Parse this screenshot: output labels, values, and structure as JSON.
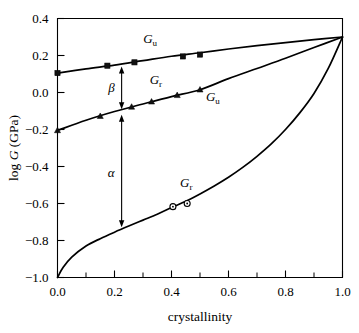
{
  "chart_data": {
    "type": "line",
    "title": "",
    "xlabel": "crystallinity",
    "ylabel": "log G (GPa)",
    "ylabel_parts": {
      "prefix": "log ",
      "italic": "G",
      "suffix": " (GPa)"
    },
    "xlim": [
      0.0,
      1.0
    ],
    "ylim": [
      -1.0,
      0.4
    ],
    "grid": false,
    "legend_position": "inline-annotations",
    "xticks": [
      0.0,
      0.2,
      0.4,
      0.6,
      0.8,
      1.0
    ],
    "xtick_labels": [
      "0.0",
      "0.2",
      "0.4",
      "0.6",
      "0.8",
      "1.0"
    ],
    "xminor_ticks": [
      0.1,
      0.3,
      0.5,
      0.7,
      0.9
    ],
    "yticks": [
      0.4,
      0.2,
      0.0,
      -0.2,
      -0.4,
      -0.6,
      -0.8,
      -1.0
    ],
    "ytick_labels": [
      "0.4",
      "0.2",
      "0.0",
      "-0.2",
      "-0.4",
      "-0.6",
      "-0.8",
      "-1.0"
    ],
    "series": [
      {
        "name": "G_u (upper bound)",
        "label": "G",
        "label_sub": "u",
        "marker": "square",
        "line": [
          {
            "x": 0.0,
            "y": 0.105
          },
          {
            "x": 0.1,
            "y": 0.128
          },
          {
            "x": 0.2,
            "y": 0.148
          },
          {
            "x": 0.3,
            "y": 0.172
          },
          {
            "x": 0.4,
            "y": 0.196
          },
          {
            "x": 0.5,
            "y": 0.215
          },
          {
            "x": 0.6,
            "y": 0.235
          },
          {
            "x": 0.7,
            "y": 0.253
          },
          {
            "x": 0.8,
            "y": 0.27
          },
          {
            "x": 0.9,
            "y": 0.286
          },
          {
            "x": 1.0,
            "y": 0.3
          }
        ],
        "points": [
          {
            "x": 0.0,
            "y": 0.105
          },
          {
            "x": 0.175,
            "y": 0.145
          },
          {
            "x": 0.27,
            "y": 0.163
          },
          {
            "x": 0.44,
            "y": 0.195
          },
          {
            "x": 0.5,
            "y": 0.205
          }
        ]
      },
      {
        "name": "G_r (intermediate)",
        "label": "G",
        "label_sub": "r",
        "marker": "triangle",
        "line": [
          {
            "x": 0.0,
            "y": -0.205
          },
          {
            "x": 0.1,
            "y": -0.15
          },
          {
            "x": 0.2,
            "y": -0.103
          },
          {
            "x": 0.3,
            "y": -0.062
          },
          {
            "x": 0.4,
            "y": -0.022
          },
          {
            "x": 0.5,
            "y": 0.015
          },
          {
            "x": 0.6,
            "y": 0.075
          },
          {
            "x": 0.7,
            "y": 0.13
          },
          {
            "x": 0.8,
            "y": 0.185
          },
          {
            "x": 0.9,
            "y": 0.243
          },
          {
            "x": 1.0,
            "y": 0.3
          }
        ],
        "points": [
          {
            "x": 0.0,
            "y": -0.205
          },
          {
            "x": 0.15,
            "y": -0.128
          },
          {
            "x": 0.26,
            "y": -0.078
          },
          {
            "x": 0.33,
            "y": -0.05
          },
          {
            "x": 0.42,
            "y": -0.015
          },
          {
            "x": 0.5,
            "y": 0.015
          }
        ]
      },
      {
        "name": "G_r (lower bound)",
        "label": "G",
        "label_sub": "r",
        "marker": "circle",
        "line": [
          {
            "x": 0.0,
            "y": -1.0
          },
          {
            "x": 0.02,
            "y": -0.945
          },
          {
            "x": 0.05,
            "y": -0.89
          },
          {
            "x": 0.1,
            "y": -0.83
          },
          {
            "x": 0.15,
            "y": -0.79
          },
          {
            "x": 0.2,
            "y": -0.755
          },
          {
            "x": 0.25,
            "y": -0.722
          },
          {
            "x": 0.3,
            "y": -0.69
          },
          {
            "x": 0.35,
            "y": -0.658
          },
          {
            "x": 0.4,
            "y": -0.622
          },
          {
            "x": 0.45,
            "y": -0.588
          },
          {
            "x": 0.5,
            "y": -0.548
          },
          {
            "x": 0.55,
            "y": -0.505
          },
          {
            "x": 0.6,
            "y": -0.458
          },
          {
            "x": 0.65,
            "y": -0.405
          },
          {
            "x": 0.7,
            "y": -0.345
          },
          {
            "x": 0.75,
            "y": -0.278
          },
          {
            "x": 0.8,
            "y": -0.2
          },
          {
            "x": 0.85,
            "y": -0.11
          },
          {
            "x": 0.9,
            "y": -0.005
          },
          {
            "x": 0.95,
            "y": 0.13
          },
          {
            "x": 1.0,
            "y": 0.3
          }
        ],
        "points": [
          {
            "x": 0.405,
            "y": -0.617
          },
          {
            "x": 0.455,
            "y": -0.6
          }
        ]
      }
    ],
    "annotations": [
      {
        "label": "β",
        "name": "beta",
        "x": 0.225,
        "y_top": 0.14,
        "y_bottom": -0.09,
        "label_y": 0.03
      },
      {
        "label": "α",
        "name": "alpha",
        "x": 0.225,
        "y_top": -0.12,
        "y_bottom": -0.728,
        "label_y": -0.43
      }
    ],
    "series_labels": [
      {
        "name": "gu-top",
        "text": "G",
        "sub": "u",
        "x": 0.325,
        "y": 0.268
      },
      {
        "name": "gr-middle",
        "text": "G",
        "sub": "r",
        "x": 0.345,
        "y": 0.048
      },
      {
        "name": "gu-middle",
        "text": "G",
        "sub": "u",
        "x": 0.545,
        "y": -0.048
      },
      {
        "name": "gr-lower",
        "text": "G",
        "sub": "r",
        "x": 0.452,
        "y": -0.512
      }
    ]
  }
}
